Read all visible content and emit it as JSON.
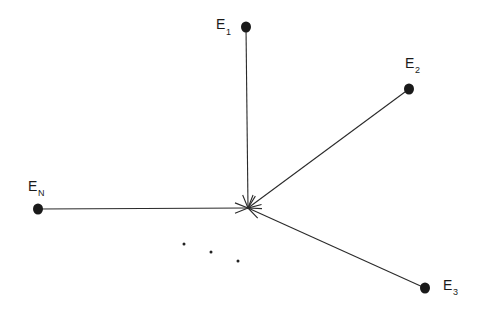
{
  "diagram": {
    "type": "star-convergence",
    "center": {
      "x": 248,
      "y": 208
    },
    "nodes": [
      {
        "id": "E1",
        "base": "E",
        "sub": "1",
        "x": 246,
        "y": 27,
        "label_x": 216,
        "label_y": 29,
        "sub_x": 226,
        "sub_y": 35
      },
      {
        "id": "E2",
        "base": "E",
        "sub": "2",
        "x": 409,
        "y": 89,
        "label_x": 405,
        "label_y": 68,
        "sub_x": 415,
        "sub_y": 73
      },
      {
        "id": "EN",
        "base": "E",
        "sub": "N",
        "x": 38,
        "y": 209,
        "label_x": 28,
        "label_y": 191,
        "sub_x": 38,
        "sub_y": 196
      },
      {
        "id": "E3",
        "base": "E",
        "sub": "3",
        "x": 425,
        "y": 288,
        "label_x": 443,
        "label_y": 290,
        "sub_x": 453,
        "sub_y": 295
      }
    ],
    "ellipsis_dots": [
      {
        "x": 184,
        "y": 244
      },
      {
        "x": 211,
        "y": 252
      },
      {
        "x": 238,
        "y": 261
      }
    ],
    "edge_style": {
      "color": "#2a2a2a",
      "arrowhead": "at-center"
    }
  }
}
